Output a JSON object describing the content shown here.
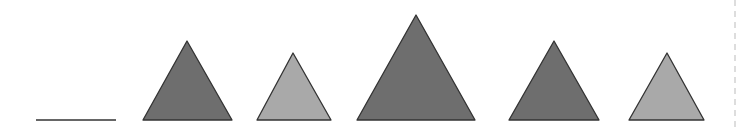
{
  "diagram": {
    "colors": {
      "dark": "#6e6e6e",
      "light": "#a9a9a9",
      "stroke": "#333333",
      "divider": "#bbbbbb"
    },
    "line_segment": {
      "x1": 36,
      "y1": 120,
      "x2": 116,
      "y2": 120
    },
    "triangles": [
      {
        "shade": "dark",
        "apex": [
          187,
          41
        ],
        "base_left": [
          143,
          120
        ],
        "base_right": [
          232,
          120
        ]
      },
      {
        "shade": "light",
        "apex": [
          293,
          53
        ],
        "base_left": [
          257,
          120
        ],
        "base_right": [
          331,
          120
        ]
      },
      {
        "shade": "dark",
        "apex": [
          416,
          15
        ],
        "base_left": [
          357,
          120
        ],
        "base_right": [
          475,
          120
        ]
      },
      {
        "shade": "dark",
        "apex": [
          554,
          41
        ],
        "base_left": [
          509,
          120
        ],
        "base_right": [
          599,
          120
        ]
      },
      {
        "shade": "light",
        "apex": [
          667,
          53
        ],
        "base_left": [
          629,
          120
        ],
        "base_right": [
          704,
          120
        ]
      }
    ],
    "dashed_divider": {
      "x": 735,
      "y1": 0,
      "y2": 128
    }
  }
}
